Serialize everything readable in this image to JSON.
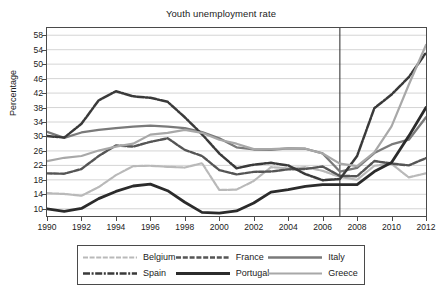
{
  "chart_data": {
    "type": "line",
    "title": "Youth unemployment rate",
    "xlabel": "",
    "ylabel": "Percentage",
    "xlim": [
      1990,
      2012
    ],
    "ylim": [
      8,
      60
    ],
    "yticks": [
      10,
      14,
      18,
      22,
      26,
      30,
      34,
      38,
      42,
      46,
      50,
      54,
      58
    ],
    "xticks": [
      1990,
      1992,
      1994,
      1996,
      1998,
      2000,
      2002,
      2004,
      2006,
      2008,
      2010,
      2012
    ],
    "grid": "horizontal",
    "legend_position": "below",
    "annotations": [
      {
        "type": "vertical-line",
        "x": 2007,
        "label": ""
      }
    ],
    "x": [
      1990,
      1991,
      1992,
      1993,
      1994,
      1995,
      1996,
      1997,
      1998,
      1999,
      2000,
      2001,
      2002,
      2003,
      2004,
      2005,
      2006,
      2007,
      2008,
      2009,
      2010,
      2011,
      2012
    ],
    "series": [
      {
        "name": "Belgium",
        "color": "#b9b9b9",
        "style": "light-gray",
        "values": [
          14.3,
          14.1,
          13.6,
          16.0,
          19.3,
          21.8,
          21.9,
          21.6,
          21.4,
          22.6,
          15.2,
          15.3,
          17.7,
          21.5,
          21.2,
          21.5,
          20.5,
          18.8,
          18.0,
          21.9,
          22.4,
          18.7,
          19.8
        ]
      },
      {
        "name": "France",
        "color": "#555555",
        "style": "dashed-dark",
        "values": [
          19.8,
          19.7,
          21.0,
          24.6,
          27.5,
          27.2,
          28.5,
          29.5,
          26.3,
          24.6,
          20.7,
          19.5,
          20.2,
          20.3,
          20.9,
          21.0,
          21.7,
          19.1,
          19.0,
          23.2,
          22.5,
          22.0,
          24.0
        ]
      },
      {
        "name": "Italy",
        "color": "#7a7a7a",
        "style": "medium-gray",
        "values": [
          31.3,
          29.6,
          31.1,
          31.8,
          32.3,
          32.7,
          33.0,
          32.7,
          32.3,
          31.2,
          29.5,
          27.0,
          26.4,
          26.3,
          26.7,
          26.6,
          25.3,
          20.3,
          21.3,
          25.4,
          27.8,
          29.1,
          35.3
        ]
      },
      {
        "name": "Spain",
        "color": "#3a3a3a",
        "style": "dash-dot-dark",
        "values": [
          30.1,
          29.7,
          33.5,
          40.0,
          42.5,
          41.1,
          40.7,
          39.6,
          35.3,
          30.6,
          25.3,
          21.2,
          22.2,
          22.7,
          22.0,
          19.6,
          17.9,
          18.2,
          24.6,
          37.8,
          41.6,
          46.4,
          53.2
        ]
      },
      {
        "name": "Portugal",
        "color": "#2b2b2b",
        "style": "solid-thick-dark",
        "values": [
          10.0,
          9.3,
          10.1,
          12.8,
          14.8,
          16.3,
          16.8,
          15.0,
          11.8,
          9.0,
          8.8,
          9.4,
          11.6,
          14.6,
          15.3,
          16.2,
          16.7,
          16.7,
          16.7,
          20.3,
          22.8,
          30.1,
          38.0
        ]
      },
      {
        "name": "Greece",
        "color": "#a8a8a8",
        "style": "light-gray-2",
        "values": [
          23.2,
          24.1,
          24.6,
          26.1,
          27.2,
          28.0,
          30.5,
          31.0,
          31.8,
          31.0,
          29.1,
          28.0,
          26.5,
          26.5,
          26.7,
          26.6,
          25.3,
          22.5,
          21.8,
          25.6,
          32.8,
          44.3,
          55.3
        ]
      }
    ]
  },
  "legend": {
    "rows": [
      [
        {
          "name": "Belgium",
          "key": "belgium"
        },
        {
          "name": "France",
          "key": "france"
        },
        {
          "name": "Italy",
          "key": "italy"
        }
      ],
      [
        {
          "name": "Spain",
          "key": "spain"
        },
        {
          "name": "Portugal",
          "key": "portugal"
        },
        {
          "name": "Greece",
          "key": "greece"
        }
      ]
    ]
  }
}
